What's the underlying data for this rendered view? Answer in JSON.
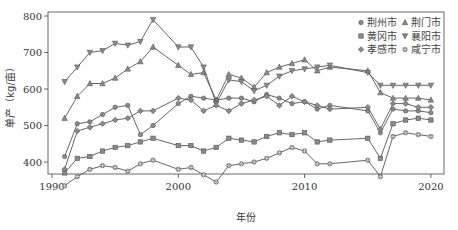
{
  "chart_data": {
    "type": "line",
    "title": "",
    "xlabel": "年份",
    "ylabel": "单产（kg/亩）",
    "xlim": [
      1989.3,
      2021.3
    ],
    "ylim": [
      325,
      805
    ],
    "xticks": [
      1990,
      2000,
      2010,
      2020
    ],
    "yticks": [
      400,
      500,
      600,
      700,
      800
    ],
    "grid": false,
    "legend_position": "upper right",
    "x": [
      1991,
      1992,
      1993,
      1994,
      1995,
      1996,
      1997,
      1998,
      2000,
      2001,
      2002,
      2003,
      2004,
      2005,
      2006,
      2007,
      2008,
      2009,
      2010,
      2011,
      2012,
      2015,
      2016,
      2017,
      2018,
      2019,
      2020
    ],
    "series": [
      {
        "name": "荆州市",
        "marker": "circle",
        "values": [
          415,
          505,
          510,
          530,
          550,
          555,
          475,
          500,
          560,
          580,
          575,
          570,
          575,
          575,
          565,
          585,
          575,
          560,
          565,
          545,
          555,
          540,
          480,
          545,
          540,
          540,
          535
        ]
      },
      {
        "name": "荆门市",
        "marker": "triangle-up",
        "values": [
          520,
          580,
          615,
          615,
          630,
          655,
          675,
          715,
          665,
          640,
          645,
          570,
          640,
          630,
          605,
          645,
          660,
          670,
          680,
          650,
          660,
          650,
          590,
          575,
          575,
          575,
          570
        ]
      },
      {
        "name": "黄冈市",
        "marker": "square",
        "values": [
          370,
          410,
          415,
          430,
          440,
          445,
          455,
          465,
          445,
          445,
          430,
          440,
          465,
          460,
          455,
          470,
          480,
          475,
          480,
          455,
          460,
          465,
          410,
          505,
          515,
          520,
          515
        ]
      },
      {
        "name": "襄阳市",
        "marker": "triangle-down",
        "values": [
          620,
          660,
          700,
          705,
          725,
          720,
          730,
          790,
          715,
          715,
          660,
          560,
          625,
          620,
          595,
          610,
          635,
          650,
          655,
          660,
          665,
          645,
          610,
          610,
          610,
          610,
          610
        ]
      },
      {
        "name": "孝感市",
        "marker": "diamond",
        "values": [
          380,
          485,
          495,
          505,
          515,
          520,
          540,
          540,
          575,
          570,
          540,
          555,
          540,
          560,
          570,
          580,
          555,
          580,
          565,
          555,
          545,
          550,
          490,
          560,
          560,
          550,
          550
        ]
      },
      {
        "name": "咸宁市",
        "marker": "circle-plus",
        "values": [
          335,
          360,
          380,
          390,
          385,
          375,
          395,
          405,
          380,
          385,
          365,
          345,
          390,
          395,
          400,
          410,
          425,
          440,
          430,
          395,
          395,
          405,
          360,
          470,
          480,
          475,
          470
        ]
      }
    ]
  },
  "legend": {
    "items": [
      {
        "label": "荆州市",
        "marker": "circle"
      },
      {
        "label": "荆门市",
        "marker": "triangle-up"
      },
      {
        "label": "黄冈市",
        "marker": "square"
      },
      {
        "label": "襄阳市",
        "marker": "triangle-down"
      },
      {
        "label": "孝感市",
        "marker": "diamond"
      },
      {
        "label": "咸宁市",
        "marker": "circle-plus"
      }
    ]
  },
  "colors": {
    "line": "#555555",
    "marker_fill": "#8a8a8a",
    "marker_stroke": "#555555",
    "axis": "#444444",
    "text": "#333333"
  }
}
